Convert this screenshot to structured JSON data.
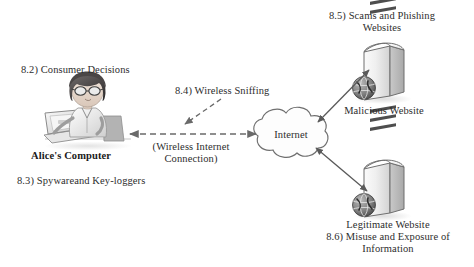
{
  "diagram": {
    "background_color": "#ffffff",
    "ink_color": "#3a3a3a",
    "labels": {
      "consumer_decisions": "8.2) Consumer Decisions",
      "alices_computer": "Alice's Computer",
      "spyware_keyloggers": "8.3) Spywareand Key-loggers",
      "wireless_sniffing": "8.4) Wireless Sniffing",
      "wireless_connection": "(Wireless Internet Connection)",
      "internet": "Internet",
      "scams_phishing": "8.5) Scams and Phishing Websites",
      "malicious_website": "Malicious Website",
      "legitimate_website": "Legitimate Website",
      "misuse_exposure": "8.6) Misuse and Exposure of Information"
    },
    "nodes": [
      {
        "name": "alice-computer-node",
        "label": "Alice's Computer",
        "kind": "person-at-laptop"
      },
      {
        "name": "internet-cloud-node",
        "label": "Internet",
        "kind": "cloud"
      },
      {
        "name": "malicious-server-node",
        "label": "Malicious Website",
        "kind": "server-tower-with-globe"
      },
      {
        "name": "legitimate-server-node",
        "label": "Legitimate Website",
        "kind": "server-tower-with-globe"
      }
    ],
    "connections": [
      {
        "name": "alice-to-internet-link",
        "from": "alice-computer-node",
        "to": "internet-cloud-node",
        "style": "dashed",
        "arrows": "both",
        "label": "(Wireless Internet Connection)"
      },
      {
        "name": "sniffing-attack-arrow",
        "from": "wireless-sniffing-label",
        "to": "alice-to-internet-link",
        "style": "dashed",
        "arrows": "single",
        "label": "8.4) Wireless Sniffing"
      },
      {
        "name": "internet-to-malicious-link",
        "from": "internet-cloud-node",
        "to": "malicious-server-node",
        "style": "solid",
        "arrows": "both"
      },
      {
        "name": "internet-to-legitimate-link",
        "from": "internet-cloud-node",
        "to": "legitimate-server-node",
        "style": "solid",
        "arrows": "both"
      }
    ]
  }
}
